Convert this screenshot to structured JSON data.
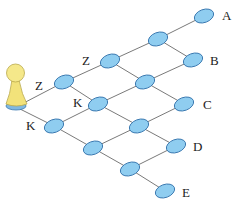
{
  "diagram": {
    "type": "lattice-path-graph",
    "colors": {
      "node_fill": "#8fcdf0",
      "node_stroke": "#3a78b0",
      "edge": "#7a7a7a",
      "pawn_fill": "#f2e27a",
      "pawn_stroke": "#b9a84a",
      "pawn_base": "#7fb8e0"
    },
    "nodes": [
      {
        "id": "n0",
        "x": 204,
        "y": 16
      },
      {
        "id": "n1",
        "x": 158,
        "y": 39
      },
      {
        "id": "n2",
        "x": 193,
        "y": 60
      },
      {
        "id": "n3",
        "x": 110,
        "y": 61
      },
      {
        "id": "n4",
        "x": 145,
        "y": 82
      },
      {
        "id": "n5",
        "x": 184,
        "y": 104
      },
      {
        "id": "n6",
        "x": 64,
        "y": 82
      },
      {
        "id": "n7",
        "x": 98,
        "y": 104
      },
      {
        "id": "n8",
        "x": 139,
        "y": 126
      },
      {
        "id": "n9",
        "x": 176,
        "y": 146
      },
      {
        "id": "n10",
        "x": 54,
        "y": 126
      },
      {
        "id": "n11",
        "x": 93,
        "y": 148
      },
      {
        "id": "n12",
        "x": 130,
        "y": 169
      },
      {
        "id": "n13",
        "x": 165,
        "y": 191
      }
    ],
    "edges": [
      [
        "start",
        "n6"
      ],
      [
        "start",
        "n10"
      ],
      [
        "n6",
        "n3"
      ],
      [
        "n3",
        "n1"
      ],
      [
        "n1",
        "n0"
      ],
      [
        "n6",
        "n7"
      ],
      [
        "n3",
        "n4"
      ],
      [
        "n1",
        "n2"
      ],
      [
        "n10",
        "n7"
      ],
      [
        "n7",
        "n4"
      ],
      [
        "n4",
        "n2"
      ],
      [
        "n10",
        "n11"
      ],
      [
        "n7",
        "n8"
      ],
      [
        "n4",
        "n5"
      ],
      [
        "n11",
        "n8"
      ],
      [
        "n8",
        "n5"
      ],
      [
        "n11",
        "n12"
      ],
      [
        "n8",
        "n9"
      ],
      [
        "n12",
        "n9"
      ],
      [
        "n12",
        "n13"
      ]
    ],
    "start": {
      "x": 16,
      "y": 107
    },
    "labels": {
      "A": "A",
      "B": "B",
      "C": "C",
      "D": "D",
      "E": "E",
      "z_upper": "Z",
      "z_left": "Z",
      "k_center": "K",
      "k_left": "K"
    }
  }
}
